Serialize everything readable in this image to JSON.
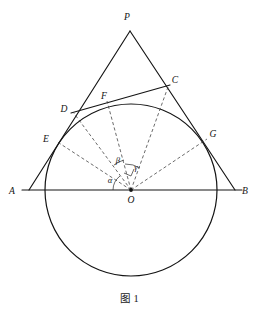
{
  "figure": {
    "caption": "图 1",
    "caption_label": "Figure 1",
    "width": 259,
    "height": 315,
    "stroke_color": "#141414",
    "dash_color": "#3a3a3a",
    "background": "#ffffff"
  },
  "points": {
    "P": {
      "label": "P",
      "x": 130,
      "y": 31,
      "label_x": 127,
      "label_y": 20,
      "role": "apex-vertex"
    },
    "A": {
      "label": "A",
      "x": 29,
      "y": 190,
      "label_x": 12,
      "label_y": 194,
      "role": "base-left-vertex"
    },
    "B": {
      "label": "B",
      "x": 235,
      "y": 190,
      "label_x": 242,
      "label_y": 194,
      "role": "base-right-vertex"
    },
    "C": {
      "label": "C",
      "x": 168,
      "y": 86,
      "label_x": 173,
      "label_y": 83,
      "role": "tangent-line-endpoint"
    },
    "D": {
      "label": "D",
      "x": 73,
      "y": 112,
      "label_x": 63,
      "label_y": 111,
      "role": "tangent-line-endpoint"
    },
    "E": {
      "label": "E",
      "x": 56,
      "y": 141,
      "label_x": 45,
      "label_y": 141,
      "role": "tangency-point-on-AP"
    },
    "F": {
      "label": "F",
      "x": 107,
      "y": 101,
      "label_x": 103,
      "label_y": 98,
      "role": "tangency-point-on-DC"
    },
    "G": {
      "label": "G",
      "x": 207,
      "y": 139,
      "label_x": 211,
      "label_y": 137,
      "role": "tangency-point-on-BP"
    },
    "O": {
      "label": "O",
      "x": 131,
      "y": 190,
      "label_x": 128,
      "label_y": 202,
      "role": "circle-center"
    }
  },
  "circle": {
    "center_x": 131,
    "center_y": 190,
    "radius": 86,
    "name": "inscribed-circle"
  },
  "segments": [
    {
      "name": "segment-AP",
      "from": "A",
      "to": "P",
      "style": "solid"
    },
    {
      "name": "segment-BP",
      "from": "B",
      "to": "P",
      "style": "solid"
    },
    {
      "name": "segment-AB",
      "from": "A",
      "to": "B",
      "style": "solid"
    },
    {
      "name": "segment-DC",
      "from": "D",
      "to": "C",
      "style": "solid"
    },
    {
      "name": "radius-OE",
      "from": "O",
      "to": "E",
      "style": "dashed"
    },
    {
      "name": "radius-OD",
      "from": "O",
      "to": "D",
      "style": "dashed"
    },
    {
      "name": "radius-OF",
      "from": "O",
      "to": "F",
      "style": "dashed"
    },
    {
      "name": "radius-OC",
      "from": "O",
      "to": "C",
      "style": "dashed"
    },
    {
      "name": "radius-OG",
      "from": "O",
      "to": "G",
      "style": "dashed"
    }
  ],
  "angles": [
    {
      "label": "α",
      "name": "angle-alpha",
      "label_x": 109,
      "label_y": 182,
      "vertex": "O",
      "between": [
        "A",
        "E"
      ]
    },
    {
      "label": "β",
      "name": "angle-beta",
      "label_x": 117,
      "label_y": 163,
      "vertex": "O",
      "between": [
        "D",
        "F"
      ]
    },
    {
      "label": "γ",
      "name": "angle-gamma",
      "label_x": 134,
      "label_y": 169,
      "vertex": "O",
      "between": [
        "F",
        "C"
      ]
    }
  ],
  "marks": {
    "right_angle": {
      "name": "right-angle-mark-OF",
      "at": "O",
      "along": "OF"
    }
  }
}
